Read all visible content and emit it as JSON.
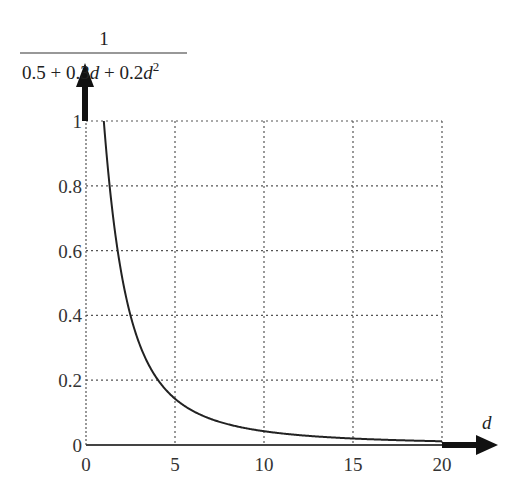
{
  "chart_data": {
    "type": "line",
    "title": "",
    "ylabel": {
      "numerator": "1",
      "denominator_parts": [
        "0.5 + 0.3",
        "d",
        " + 0.2",
        "d",
        "2"
      ]
    },
    "xlabel": "d",
    "xlim": [
      0,
      20
    ],
    "ylim": [
      0,
      1
    ],
    "x_ticks": [
      "0",
      "5",
      "10",
      "15",
      "20"
    ],
    "y_ticks": [
      "0",
      "0.2",
      "0.4",
      "0.6",
      "0.8",
      "1"
    ],
    "grid": true,
    "legend": null,
    "function": "1/(0.5+0.3d+0.2d^2)",
    "series": [
      {
        "name": "1/(0.5+0.3d+0.2d^2)",
        "x": [
          1,
          1.5,
          2,
          2.5,
          3,
          3.5,
          4,
          5,
          6,
          7,
          8,
          9,
          10,
          12,
          14,
          16,
          18,
          20
        ],
        "values": [
          1.0,
          0.656,
          0.455,
          0.331,
          0.25,
          0.195,
          0.156,
          0.105,
          0.075,
          0.056,
          0.044,
          0.035,
          0.029,
          0.02,
          0.015,
          0.012,
          0.009,
          0.008
        ]
      }
    ],
    "colors": {
      "line": "#222222",
      "grid": "#555555",
      "axis": "#222222"
    }
  }
}
